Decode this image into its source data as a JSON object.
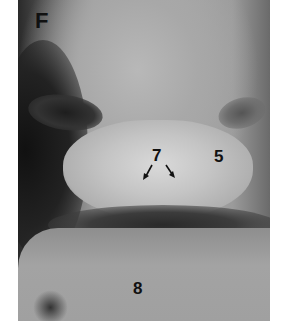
{
  "figure": {
    "panel_label": "F",
    "labels": [
      {
        "id": "7",
        "text": "7",
        "note": "two arrows pointing down-left and down-right"
      },
      {
        "id": "5",
        "text": "5"
      },
      {
        "id": "8",
        "text": "8"
      }
    ]
  }
}
